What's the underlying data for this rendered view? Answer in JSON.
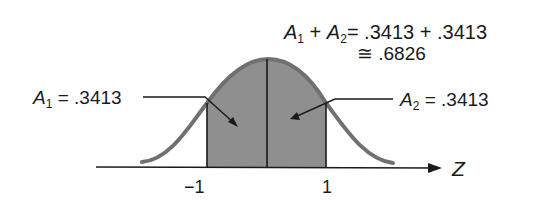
{
  "diagram": {
    "title_equation": {
      "line1_a1": "A",
      "line1_a1_sub": "1",
      "line1_plus": "+",
      "line1_a2": "A",
      "line1_a2_sub": "2",
      "line1_rhs": "= .3413 + .3413",
      "line2": "≅ .6826"
    },
    "label_a1": {
      "var": "A",
      "sub": "1",
      "value": "= .3413"
    },
    "label_a2": {
      "var": "A",
      "sub": "2",
      "value": "= .3413"
    },
    "axis": {
      "label": "Z",
      "ticks": [
        "−1",
        "1"
      ]
    },
    "colors": {
      "shade": "#8c8c8c",
      "curve": "#6e6e6e",
      "ink": "#1a1a1a"
    }
  }
}
